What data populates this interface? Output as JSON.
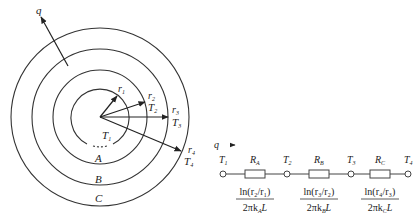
{
  "figure": {
    "cylinder": {
      "heat_flow_label": "q",
      "radius_labels": [
        "r",
        "r",
        "r",
        "r"
      ],
      "radius_subscripts": [
        "1",
        "2",
        "3",
        "4"
      ],
      "temperature_labels": [
        "T",
        "T",
        "T",
        "T"
      ],
      "temperature_subscripts": [
        "1",
        "2",
        "3",
        "4"
      ],
      "layer_labels": [
        "A",
        "B",
        "C"
      ],
      "fill_color": "#e8e8e8",
      "line_color": "#333333"
    },
    "circuit": {
      "heat_flow_label": "q",
      "nodes": [
        {
          "label": "T",
          "sub": "1"
        },
        {
          "label": "T",
          "sub": "2"
        },
        {
          "label": "T",
          "sub": "3"
        },
        {
          "label": "T",
          "sub": "4"
        }
      ],
      "resistors": [
        {
          "label": "R",
          "sub": "A",
          "num": "ln(r₂/r₁)",
          "den": "2πk",
          "den_sub": "A",
          "den_tail": "L"
        },
        {
          "label": "R",
          "sub": "B",
          "num": "ln(r₃/r₂)",
          "den": "2πk",
          "den_sub": "B",
          "den_tail": "L"
        },
        {
          "label": "R",
          "sub": "C",
          "num": "ln(r₄/r₃)",
          "den": "2πk",
          "den_sub": "C",
          "den_tail": "L"
        }
      ]
    }
  }
}
